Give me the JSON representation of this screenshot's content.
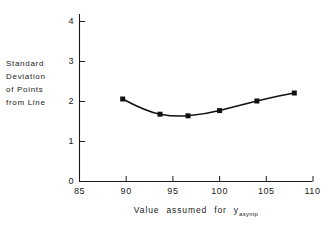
{
  "chart_data": {
    "type": "line",
    "title": "",
    "subtitle": "",
    "xlabel": "Value assumed for y",
    "xlabel_subscript": "asymp",
    "ylabel_lines": [
      "Standard",
      "Deviation",
      "of Points",
      "from Line"
    ],
    "ylabel": "Standard Deviation of Points from Line",
    "x": [
      90,
      94,
      97,
      100,
      104,
      108
    ],
    "values": [
      2.05,
      1.67,
      1.63,
      1.76,
      2.0,
      2.2
    ],
    "series": [
      {
        "name": "Standard deviation of points from line",
        "x": [
          90,
          94,
          97,
          100,
          104,
          108
        ],
        "values": [
          2.05,
          1.67,
          1.63,
          1.76,
          2.0,
          2.2
        ]
      }
    ],
    "xlim": [
      85,
      110
    ],
    "ylim": [
      0,
      4.55
    ],
    "xticks": [
      85,
      90,
      95,
      100,
      105,
      110
    ],
    "xtick_labels": [
      "85",
      "90",
      "95",
      "100",
      "105",
      "110"
    ],
    "yticks": [
      0,
      1,
      2,
      3,
      4
    ],
    "ytick_labels": [
      "0",
      "1",
      "2",
      "3",
      "4"
    ],
    "grid": false,
    "legend": false,
    "marker": "filled-square",
    "line_color": "#111111",
    "marker_color": "#111111",
    "background_color": "#ffffff"
  }
}
